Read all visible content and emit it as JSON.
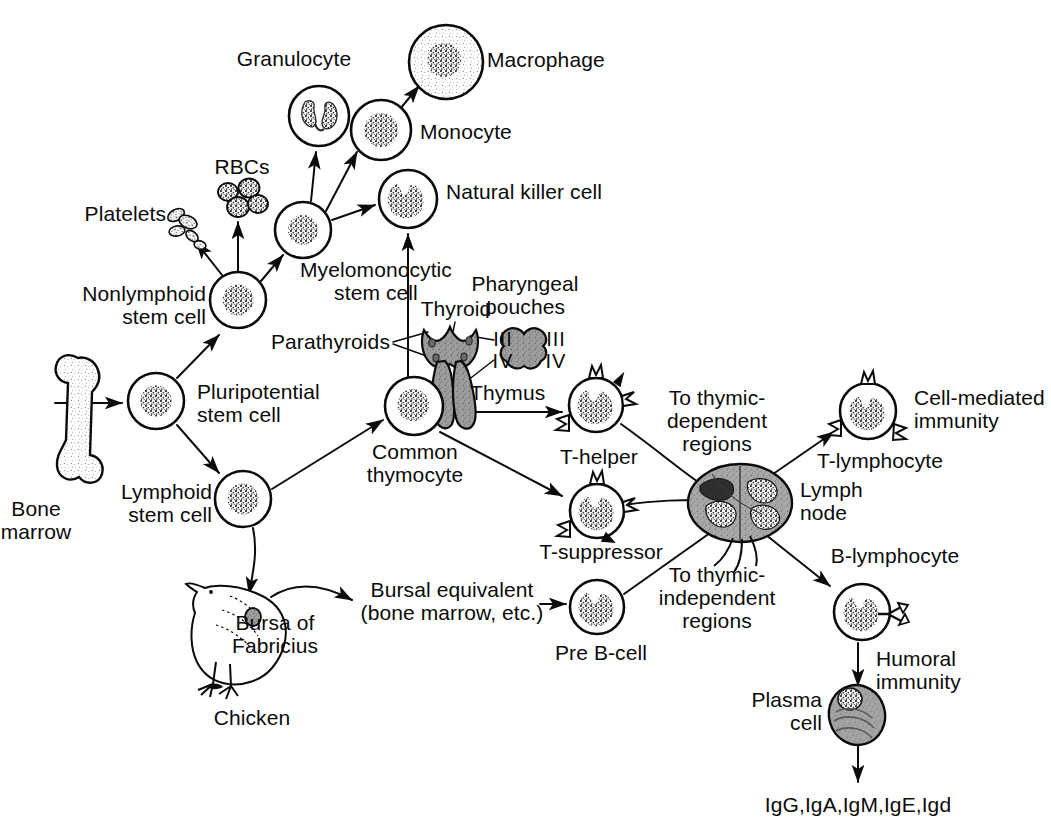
{
  "diagram": {
    "background_color": "#ffffff",
    "ink_color": "#0b0b0b",
    "organ_fill_color": "#8a8a8a"
  },
  "labels": {
    "bone_marrow": "Bone\nmarrow",
    "pluripotential_stem_cell": "Pluripotential\nstem cell",
    "nonlymphoid_stem_cell": "Nonlymphoid\nstem cell",
    "lymphoid_stem_cell": "Lymphoid\nstem cell",
    "platelets": "Platelets",
    "rbcs": "RBCs",
    "myelomonocytic_stem_cell": "Myelomonocytic\nstem cell",
    "granulocyte": "Granulocyte",
    "monocyte": "Monocyte",
    "macrophage": "Macrophage",
    "natural_killer_cell": "Natural killer cell",
    "parathyroids": "Parathyroids",
    "thyroid": "Thyroid",
    "pharyngeal_pouches": "Pharyngeal\npouches",
    "pouch_iii_left": "III",
    "pouch_iv_left": "IV",
    "pouch_iii_right": "III",
    "pouch_iv_right": "IV",
    "thymus": "Thymus",
    "common_thymocyte": "Common\nthymocyte",
    "t_helper": "T-helper",
    "t_suppressor": "T-suppressor",
    "to_thymic_dependent_regions": "To thymic-\ndependent\nregions",
    "to_thymic_independent_regions": "To thymic-\nindependent\nregions",
    "lymph_node": "Lymph\nnode",
    "t_lymphocyte": "T-lymphocyte",
    "cell_mediated_immunity": "Cell-mediated\nimmunity",
    "b_lymphocyte": "B-lymphocyte",
    "humoral_immunity": "Humoral\nimmunity",
    "plasma_cell": "Plasma\ncell",
    "immunoglobulins": "IgG,IgA,IgM,IgE,Igd",
    "chicken": "Chicken",
    "bursa_of_fabricius": "Bursa of\nFabricius",
    "bursal_equivalent": "Bursal equivalent\n(bone marrow, etc.)",
    "pre_b_cell": "Pre B-cell"
  },
  "nodes": [
    {
      "id": "bone-marrow",
      "kind": "bone",
      "x": 72,
      "y": 415,
      "label": "bone_marrow"
    },
    {
      "id": "pluripotential-stem-cell",
      "kind": "cell-round",
      "x": 156,
      "y": 401,
      "r": 28,
      "label": "pluripotential_stem_cell"
    },
    {
      "id": "nonlymphoid-stem-cell",
      "kind": "cell-round",
      "x": 238,
      "y": 300,
      "r": 28,
      "label": "nonlymphoid_stem_cell"
    },
    {
      "id": "lymphoid-stem-cell",
      "kind": "cell-round",
      "x": 243,
      "y": 499,
      "r": 28,
      "label": "lymphoid_stem_cell"
    },
    {
      "id": "myelomonocytic-stem-cell",
      "kind": "cell-round",
      "x": 303,
      "y": 230,
      "r": 28,
      "label": "myelomonocytic_stem_cell"
    },
    {
      "id": "granulocyte",
      "kind": "cell-granulo",
      "x": 319,
      "y": 116,
      "r": 30,
      "label": "granulocyte"
    },
    {
      "id": "monocyte",
      "kind": "cell-round",
      "x": 381,
      "y": 130,
      "r": 30,
      "label": "monocyte"
    },
    {
      "id": "macrophage",
      "kind": "cell-macro",
      "x": 446,
      "y": 62,
      "r": 37,
      "label": "macrophage"
    },
    {
      "id": "natural-killer-cell",
      "kind": "cell-kidney",
      "x": 408,
      "y": 199,
      "r": 29,
      "label": "natural_killer_cell"
    },
    {
      "id": "common-thymocyte",
      "kind": "cell-round",
      "x": 414,
      "y": 406,
      "r": 29,
      "label": "common_thymocyte"
    },
    {
      "id": "t-helper",
      "kind": "cell-t",
      "x": 596,
      "y": 405,
      "r": 27,
      "label": "t_helper"
    },
    {
      "id": "t-suppressor",
      "kind": "cell-t",
      "x": 597,
      "y": 511,
      "r": 27,
      "label": "t_suppressor"
    },
    {
      "id": "pre-b-cell",
      "kind": "cell-kidney",
      "x": 597,
      "y": 607,
      "r": 27,
      "label": "pre_b_cell"
    },
    {
      "id": "lymph-node",
      "kind": "lymph-node",
      "x": 740,
      "y": 505,
      "label": "lymph_node"
    },
    {
      "id": "t-lymphocyte",
      "kind": "cell-t",
      "x": 868,
      "y": 411,
      "r": 28,
      "label": "t_lymphocyte"
    },
    {
      "id": "b-lymphocyte",
      "kind": "cell-b",
      "x": 862,
      "y": 612,
      "r": 28,
      "label": "b_lymphocyte"
    },
    {
      "id": "plasma-cell",
      "kind": "plasma",
      "x": 855,
      "y": 713,
      "label": "plasma_cell"
    },
    {
      "id": "thyroid-thymus",
      "kind": "organ",
      "x": 455,
      "y": 380,
      "label": "thymus"
    },
    {
      "id": "pharyngeal-pouch",
      "kind": "pouch",
      "x": 518,
      "y": 337,
      "label": "pharyngeal_pouches"
    },
    {
      "id": "chicken",
      "kind": "chicken",
      "x": 245,
      "y": 615,
      "label": "chicken"
    },
    {
      "id": "platelets",
      "kind": "platelets",
      "x": 190,
      "y": 225,
      "label": "platelets"
    },
    {
      "id": "rbcs",
      "kind": "rbcs",
      "x": 242,
      "y": 196,
      "label": "rbcs"
    }
  ],
  "edges": [
    {
      "from": "bone-marrow",
      "to": "pluripotential-stem-cell"
    },
    {
      "from": "pluripotential-stem-cell",
      "to": "nonlymphoid-stem-cell"
    },
    {
      "from": "pluripotential-stem-cell",
      "to": "lymphoid-stem-cell"
    },
    {
      "from": "nonlymphoid-stem-cell",
      "to": "platelets"
    },
    {
      "from": "nonlymphoid-stem-cell",
      "to": "rbcs"
    },
    {
      "from": "nonlymphoid-stem-cell",
      "to": "myelomonocytic-stem-cell"
    },
    {
      "from": "myelomonocytic-stem-cell",
      "to": "granulocyte"
    },
    {
      "from": "myelomonocytic-stem-cell",
      "to": "monocyte"
    },
    {
      "from": "myelomonocytic-stem-cell",
      "to": "natural-killer-cell"
    },
    {
      "from": "monocyte",
      "to": "macrophage"
    },
    {
      "from": "common-thymocyte",
      "to": "natural-killer-cell"
    },
    {
      "from": "lymphoid-stem-cell",
      "to": "common-thymocyte"
    },
    {
      "from": "lymphoid-stem-cell",
      "to": "chicken"
    },
    {
      "from": "common-thymocyte",
      "to": "t-helper"
    },
    {
      "from": "common-thymocyte",
      "to": "t-suppressor"
    },
    {
      "from": "chicken",
      "to": "bursal-equivalent"
    },
    {
      "from": "bursal-equivalent",
      "to": "pre-b-cell"
    },
    {
      "from": "t-helper",
      "to": "lymph-node"
    },
    {
      "from": "t-suppressor",
      "to": "lymph-node"
    },
    {
      "from": "pre-b-cell",
      "to": "lymph-node"
    },
    {
      "from": "lymph-node",
      "to": "t-lymphocyte"
    },
    {
      "from": "lymph-node",
      "to": "b-lymphocyte"
    },
    {
      "from": "b-lymphocyte",
      "to": "plasma-cell"
    },
    {
      "from": "plasma-cell",
      "to": "immunoglobulins"
    }
  ]
}
